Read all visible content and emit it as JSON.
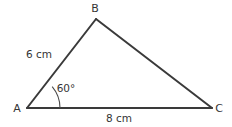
{
  "figure": {
    "canvas": {
      "width": 232,
      "height": 127,
      "background": "#ffffff"
    },
    "stroke_color": "#3a3a3a",
    "text_color": "#353535",
    "vertices": [
      {
        "name": "A",
        "label": "A",
        "x": 27,
        "y": 108,
        "label_x": 17,
        "label_y": 108
      },
      {
        "name": "B",
        "label": "B",
        "x": 96,
        "y": 19,
        "label_x": 95,
        "label_y": 8
      },
      {
        "name": "C",
        "label": "C",
        "x": 212,
        "y": 108,
        "label_x": 219,
        "label_y": 108
      }
    ],
    "sides": [
      {
        "name": "AB",
        "label": "6 cm",
        "from": "A",
        "to": "B",
        "label_x": 39,
        "label_y": 54
      },
      {
        "name": "BC",
        "label": "",
        "from": "B",
        "to": "C",
        "label_x": 0,
        "label_y": 0
      },
      {
        "name": "AC",
        "label": "8 cm",
        "from": "A",
        "to": "C",
        "label_x": 119,
        "label_y": 118
      }
    ],
    "angles": [
      {
        "at": "A",
        "label": "60°",
        "value": 60,
        "unit": "degrees",
        "arc_radius": 33,
        "label_x": 66,
        "label_y": 88
      }
    ]
  }
}
